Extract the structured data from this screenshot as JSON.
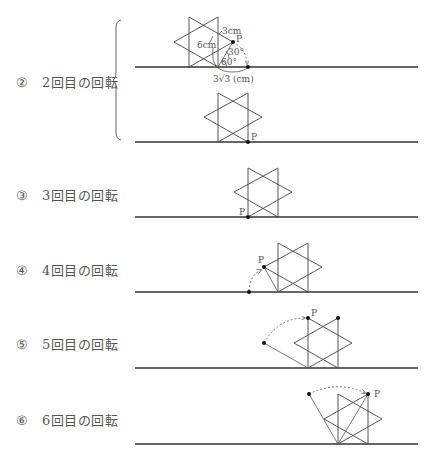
{
  "sections": [
    {
      "marker": "②",
      "text": "2回目の回転",
      "label_y": 72
    },
    {
      "marker": "③",
      "text": "3回目の回転",
      "label_y": 185
    },
    {
      "marker": "④",
      "text": "4回目の回転",
      "label_y": 260
    },
    {
      "marker": "⑤",
      "text": "5回目の回転",
      "label_y": 334
    },
    {
      "marker": "⑥",
      "text": "6回目の回転",
      "label_y": 410
    }
  ],
  "annotations": {
    "point_label": "P",
    "len_3cm": "3cm",
    "len_6cm": "6cm",
    "angle_30": "30°",
    "angle_60": "60°",
    "arc_len": "3√3 (cm)"
  },
  "colors": {
    "line": "#444444",
    "baseline": "#333333",
    "text": "#555555"
  }
}
